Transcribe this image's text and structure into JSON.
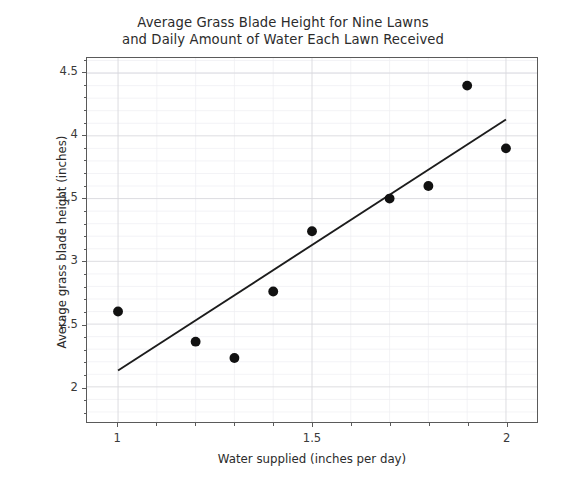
{
  "chart_data": {
    "type": "scatter",
    "title": "Average Grass Blade Height for Nine Lawns\nand Daily Amount of Water Each Lawn Received",
    "xlabel": "Water supplied (inches per day)",
    "ylabel": "Average grass blade height (inches)",
    "xlim": [
      0.92,
      2.08
    ],
    "ylim": [
      1.72,
      4.62
    ],
    "grid": true,
    "legend": null,
    "x_ticks": [
      1,
      1.5,
      2
    ],
    "x_tick_labels": [
      "1",
      "1.5",
      "2"
    ],
    "x_minor_ticks": [
      1.1,
      1.2,
      1.3,
      1.4,
      1.6,
      1.7,
      1.8,
      1.9
    ],
    "y_ticks": [
      2,
      2.5,
      3,
      3.5,
      4,
      4.5
    ],
    "y_tick_labels": [
      "2",
      "2.5",
      "3",
      "3.5",
      "4",
      "4.5"
    ],
    "y_minor_ticks": [
      1.8,
      1.9,
      2.1,
      2.2,
      2.3,
      2.4,
      2.6,
      2.7,
      2.8,
      2.9,
      3.1,
      3.2,
      3.3,
      3.4,
      3.6,
      3.7,
      3.8,
      3.9,
      4.1,
      4.2,
      4.3,
      4.4,
      4.5,
      4.6
    ],
    "x": [
      1.0,
      1.2,
      1.3,
      1.4,
      1.5,
      1.7,
      1.8,
      1.9,
      2.0
    ],
    "y": [
      2.6,
      2.36,
      2.23,
      2.76,
      3.24,
      3.5,
      3.6,
      4.4,
      3.9
    ],
    "points": [
      {
        "x": 1.0,
        "y": 2.6
      },
      {
        "x": 1.2,
        "y": 2.36
      },
      {
        "x": 1.3,
        "y": 2.23
      },
      {
        "x": 1.4,
        "y": 2.76
      },
      {
        "x": 1.5,
        "y": 3.24
      },
      {
        "x": 1.7,
        "y": 3.5
      },
      {
        "x": 1.8,
        "y": 3.6
      },
      {
        "x": 1.9,
        "y": 4.4
      },
      {
        "x": 2.0,
        "y": 3.9
      }
    ],
    "marker": {
      "shape": "circle",
      "size": 7.5,
      "color": "#111111"
    },
    "trendline": {
      "type": "line-of-best-fit",
      "x_start": 1.0,
      "y_start": 2.13,
      "x_end": 2.0,
      "y_end": 4.13,
      "color": "#1c1c1c"
    },
    "colors": {
      "marker": "#111111",
      "trendline": "#1c1c1c",
      "grid_major": "#d9d9de",
      "grid_minor": "#eeeef2",
      "axis": "#5a5a5a",
      "background": "#ffffff",
      "text": "#2b2b2b"
    }
  }
}
